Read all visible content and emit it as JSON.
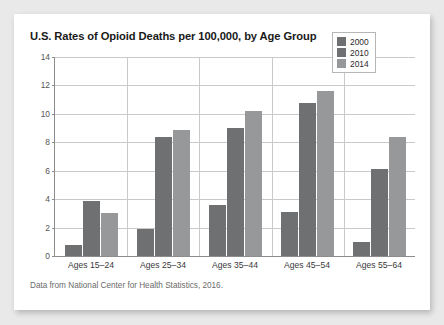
{
  "figure": {
    "title": "U.S. Rates of Opioid Deaths per 100,000, by Age Group",
    "source_note": "Data from National Center for Health Statistics, 2016.",
    "card_background": "#ffffff",
    "page_background": "#e9e9e9"
  },
  "chart_data": {
    "type": "bar",
    "title": "U.S. Rates of Opioid Deaths per 100,000, by Age Group",
    "xlabel": "",
    "ylabel": "",
    "ylim": [
      0,
      14
    ],
    "yticks": [
      0,
      2,
      4,
      6,
      8,
      10,
      12,
      14
    ],
    "ytick_labels": [
      "0",
      "2",
      "4",
      "6",
      "8",
      "10",
      "12",
      "14"
    ],
    "grid": true,
    "legend_position": "top-right",
    "categories": [
      "Ages 15–24",
      "Ages 25–34",
      "Ages 35–44",
      "Ages 45–54",
      "Ages 55–64"
    ],
    "series": [
      {
        "name": "2000",
        "color": "#6f7072",
        "values": [
          0.8,
          1.9,
          3.6,
          3.1,
          1.0
        ]
      },
      {
        "name": "2010",
        "color": "#6f7072",
        "values": [
          3.9,
          8.4,
          9.0,
          10.8,
          6.1
        ]
      },
      {
        "name": "2014",
        "color": "#97989a",
        "values": [
          3.0,
          8.9,
          10.2,
          11.6,
          8.4
        ]
      }
    ],
    "annotations": [
      "Data from National Center for Health Statistics, 2016."
    ]
  }
}
